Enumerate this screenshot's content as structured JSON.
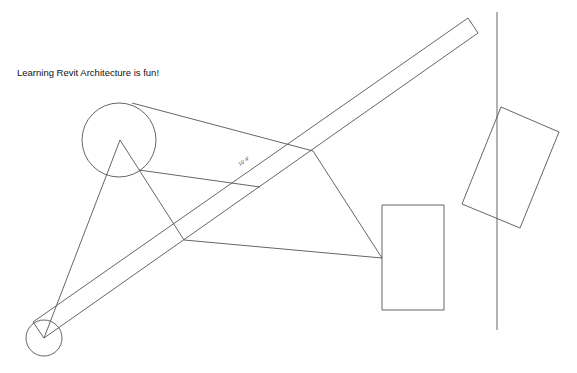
{
  "canvas": {
    "text_note": "Learning Revit Architecture is fun!",
    "dimension_label": "10' 4\"",
    "line_color": "#555555",
    "background": "#ffffff"
  },
  "elements": {
    "big_circle": {
      "cx": 119,
      "cy": 140,
      "r": 37
    },
    "small_circle": {
      "cx": 44,
      "cy": 338,
      "r": 18
    },
    "rectangle": {
      "x": 382,
      "y": 205,
      "w": 62,
      "h": 105
    },
    "rotated_rectangle": [
      [
        501,
        107
      ],
      [
        559,
        132
      ],
      [
        520,
        228
      ],
      [
        462,
        204
      ]
    ],
    "vertical_line": {
      "x": 497,
      "y1": 12,
      "y2": 330
    },
    "wall_band": [
      [
        33,
        322
      ],
      [
        468,
        18
      ],
      [
        478,
        33
      ],
      [
        44,
        338
      ]
    ]
  }
}
